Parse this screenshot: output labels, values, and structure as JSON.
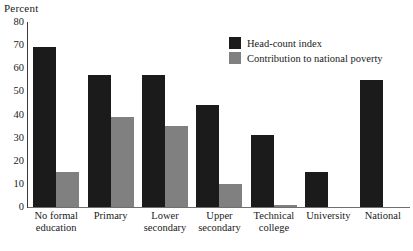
{
  "chart_data": {
    "type": "bar",
    "title": "",
    "xlabel": "",
    "ylabel": "Percent",
    "ylim": [
      0,
      80
    ],
    "ytick_step": 10,
    "yticks": [
      80,
      70,
      60,
      50,
      40,
      30,
      20,
      10,
      0
    ],
    "grid": false,
    "legend_position": "upper right",
    "categories": [
      "No formal\neducation",
      "Primary",
      "Lower\nsecondary",
      "Upper\nsecondary",
      "Technical\ncollege",
      "University",
      "National"
    ],
    "series": [
      {
        "name": "Head-count index",
        "color": "#1b1b1b",
        "values": [
          69,
          57,
          57,
          44,
          31,
          15,
          55
        ]
      },
      {
        "name": "Contribution to national poverty",
        "color": "#808080",
        "values": [
          15,
          39,
          35,
          10,
          1,
          0,
          0
        ]
      }
    ]
  },
  "axis": {
    "y_title": "Percent"
  },
  "legend": {
    "items": [
      {
        "label": "Head-count index",
        "swatch": "dark"
      },
      {
        "label": "Contribution to national poverty",
        "swatch": "gray"
      }
    ]
  }
}
